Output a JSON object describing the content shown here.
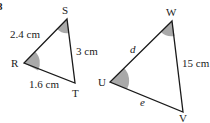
{
  "question_number": "8",
  "triangle1": {
    "vertices": {
      "R": "R",
      "S": "S",
      "T": "T"
    },
    "sides": {
      "RS": "2.4 cm",
      "ST": "3 cm",
      "RT": "1.6 cm"
    },
    "shaded_angles": [
      "R",
      "S"
    ]
  },
  "triangle2": {
    "vertices": {
      "U": "U",
      "V": "V",
      "W": "W"
    },
    "sides": {
      "UW": "d",
      "WV": "15 cm",
      "UV": "e"
    },
    "shaded_angles": [
      "U",
      "W"
    ]
  },
  "colors": {
    "line": "#1a1a1a",
    "shade": "#a9a9a9"
  }
}
